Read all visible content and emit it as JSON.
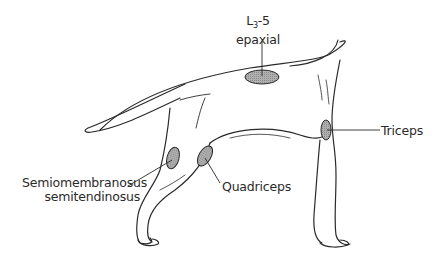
{
  "figure": {
    "background": "#ffffff",
    "line_color": "#2a2a2a",
    "site_fill": "#a0a0a0"
  },
  "labels": {
    "epaxial": {
      "line1_main": "L",
      "line1_sub": "3",
      "line1_rest": "-5",
      "line2": "epaxial"
    },
    "semimembranosus": {
      "line1": "Semiomembranosus",
      "line2": "semitendinosus"
    },
    "quadriceps": {
      "text": "Quadriceps"
    },
    "triceps": {
      "text": "Triceps"
    }
  },
  "sites": [
    {
      "name": "epaxial",
      "cx": 262,
      "cy": 77,
      "rx": 17,
      "ry": 7
    },
    {
      "name": "semimembranosus",
      "cx": 173,
      "cy": 158,
      "rx": 6,
      "ry": 11
    },
    {
      "name": "quadriceps",
      "cx": 205,
      "cy": 156,
      "rx": 6,
      "ry": 11
    },
    {
      "name": "triceps",
      "cx": 326,
      "cy": 130,
      "rx": 5,
      "ry": 10
    }
  ]
}
